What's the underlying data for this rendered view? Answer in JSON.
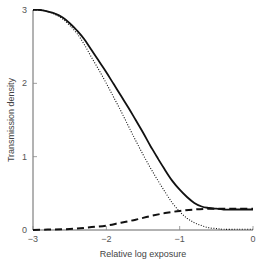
{
  "chart_data": {
    "type": "line",
    "title": "",
    "xlabel": "Relative log exposure",
    "ylabel": "Transmission density",
    "xlim": [
      -3,
      0
    ],
    "ylim": [
      0,
      3
    ],
    "xticks": [
      -3,
      -2,
      -1,
      0
    ],
    "xtick_labels": [
      "−3",
      "−2",
      "−1",
      "0"
    ],
    "yticks": [
      0,
      1,
      2,
      3
    ],
    "ytick_labels": [
      "0",
      "1",
      "2",
      "3"
    ],
    "grid": false,
    "legend": null,
    "series": [
      {
        "name": "total density",
        "style": "solid",
        "color": "#111111",
        "x": [
          -3.0,
          -2.9,
          -2.8,
          -2.7,
          -2.6,
          -2.5,
          -2.4,
          -2.3,
          -2.2,
          -2.1,
          -2.0,
          -1.9,
          -1.8,
          -1.7,
          -1.6,
          -1.5,
          -1.4,
          -1.3,
          -1.2,
          -1.1,
          -1.0,
          -0.9,
          -0.8,
          -0.7,
          -0.6,
          -0.5,
          -0.4,
          -0.2,
          0.0
        ],
        "y": [
          3.0,
          3.0,
          2.98,
          2.95,
          2.9,
          2.82,
          2.72,
          2.6,
          2.45,
          2.3,
          2.15,
          1.99,
          1.83,
          1.67,
          1.5,
          1.33,
          1.15,
          0.98,
          0.82,
          0.67,
          0.55,
          0.45,
          0.37,
          0.32,
          0.3,
          0.29,
          0.28,
          0.28,
          0.28
        ]
      },
      {
        "name": "image density",
        "style": "dotted",
        "color": "#111111",
        "x": [
          -3.0,
          -2.9,
          -2.8,
          -2.7,
          -2.6,
          -2.5,
          -2.4,
          -2.3,
          -2.2,
          -2.1,
          -2.0,
          -1.9,
          -1.8,
          -1.7,
          -1.6,
          -1.5,
          -1.4,
          -1.3,
          -1.2,
          -1.1,
          -1.0,
          -0.9,
          -0.8,
          -0.7,
          -0.6,
          -0.5,
          -0.4,
          -0.2,
          0.0
        ],
        "y": [
          3.0,
          3.0,
          2.98,
          2.94,
          2.88,
          2.79,
          2.68,
          2.53,
          2.35,
          2.18,
          2.0,
          1.81,
          1.62,
          1.42,
          1.22,
          1.03,
          0.85,
          0.68,
          0.52,
          0.37,
          0.25,
          0.16,
          0.1,
          0.06,
          0.03,
          0.02,
          0.01,
          0.01,
          0.01
        ]
      },
      {
        "name": "fog / stain density",
        "style": "dashed",
        "color": "#111111",
        "x": [
          -3.0,
          -2.8,
          -2.6,
          -2.4,
          -2.2,
          -2.0,
          -1.8,
          -1.6,
          -1.4,
          -1.2,
          -1.0,
          -0.8,
          -0.6,
          -0.4,
          -0.2,
          0.0
        ],
        "y": [
          0.0,
          0.005,
          0.01,
          0.02,
          0.04,
          0.06,
          0.1,
          0.14,
          0.19,
          0.23,
          0.26,
          0.28,
          0.29,
          0.29,
          0.29,
          0.29
        ]
      }
    ]
  }
}
